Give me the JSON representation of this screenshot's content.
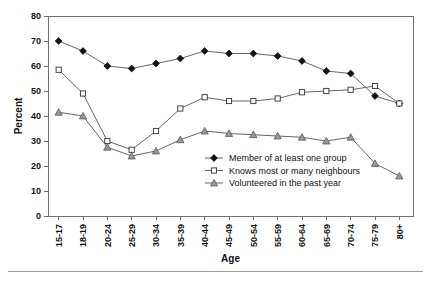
{
  "chart_data": {
    "type": "line",
    "title": "",
    "xlabel": "Age",
    "ylabel": "Percent",
    "categories": [
      "15-17",
      "18-19",
      "20-24",
      "25-29",
      "30-34",
      "35-39",
      "40-44",
      "45-49",
      "50-54",
      "55-59",
      "60-64",
      "65-69",
      "70-74",
      "75-79",
      "80+"
    ],
    "ylim": [
      0,
      80
    ],
    "yticks": [
      0,
      10,
      20,
      30,
      40,
      50,
      60,
      70,
      80
    ],
    "grid": false,
    "legend_position": "inside-center",
    "series": [
      {
        "name": "Member of at least one group",
        "marker": "filled-diamond",
        "values": [
          70,
          66,
          60,
          59,
          61,
          63,
          66,
          65,
          65,
          64,
          62,
          58,
          57,
          48,
          45
        ]
      },
      {
        "name": "Knows most or many neighbours",
        "marker": "open-square",
        "values": [
          58.5,
          49,
          30,
          26.5,
          34,
          43,
          47.5,
          46,
          46,
          47,
          49.5,
          50,
          50.5,
          52,
          45
        ]
      },
      {
        "name": "Volunteered in the past year",
        "marker": "shaded-triangle",
        "values": [
          41.5,
          40,
          27.5,
          24,
          26,
          30.5,
          34,
          33,
          32.5,
          32,
          31.5,
          30,
          31.5,
          21,
          16
        ]
      }
    ]
  },
  "colors": {
    "axis": "#6f6f6f",
    "line": "#555555",
    "diamond_fill": "#111111",
    "square_fill": "#ffffff",
    "triangle_fill": "#9a9a9a",
    "text": "#111111",
    "background": "#ffffff"
  }
}
